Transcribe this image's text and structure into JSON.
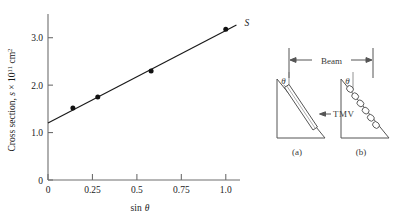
{
  "figure": {
    "caption_labels": {
      "series_label": "S",
      "tmv_label": "TMV",
      "beam_label": "Beam",
      "panel_a": "(a)",
      "panel_b": "(b)",
      "theta_a": "θ",
      "theta_b": "θ"
    }
  },
  "chart_data": {
    "type": "scatter",
    "title": "",
    "xlabel": "sin θ",
    "ylabel": "Cross section, s × 10¹¹ cm²",
    "ylabel_parts": {
      "prefix": "Cross section, ",
      "symbol": "s",
      "times": " × 10",
      "exponent": "11",
      "unit": " cm",
      "unit_exponent": "2"
    },
    "xlim": [
      0,
      1.08
    ],
    "ylim": [
      0,
      3.5
    ],
    "xticks": [
      0,
      0.25,
      0.5,
      0.75,
      1.0
    ],
    "xticklabels": [
      "0",
      "0.25",
      "0.5",
      "0.75",
      "1.0"
    ],
    "yticks": [
      0,
      1.0,
      2.0,
      3.0
    ],
    "yticklabels": [
      "0",
      "1.0",
      "2.0",
      "3.0"
    ],
    "grid": false,
    "legend": "none",
    "series": [
      {
        "name": "S",
        "marker": "filled-circle",
        "x": [
          0.14,
          0.28,
          0.58,
          1.0
        ],
        "y": [
          1.52,
          1.75,
          2.3,
          3.18
        ]
      }
    ],
    "fit_line": {
      "name": "S",
      "x": [
        0.0,
        1.06
      ],
      "y": [
        1.2,
        3.27
      ],
      "intercept": 1.2,
      "slope": 1.95
    },
    "annotations": [
      {
        "text": "S",
        "x": 1.06,
        "y": 3.3,
        "style": "italic"
      }
    ]
  },
  "diagram": {
    "type": "schematic",
    "beam": {
      "label": "Beam",
      "arrow": "double-headed"
    },
    "panels": [
      {
        "id": "a",
        "label": "(a)",
        "angle_label": "θ",
        "content": "single TMV rod inclined in wedge",
        "annotation": "TMV"
      },
      {
        "id": "b",
        "label": "(b)",
        "angle_label": "θ",
        "content": "chain of spherical particles along incline",
        "particle_count": 6
      }
    ]
  },
  "colors": {
    "ink": "#1a1a1a",
    "diagram_ink": "#4a4a4a",
    "background": "#ffffff"
  }
}
